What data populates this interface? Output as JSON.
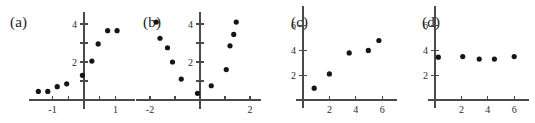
{
  "figure": {
    "title": "",
    "panel_count": 4,
    "background_color": "#ffffff",
    "point_color": "#151515",
    "axis_color": "#4a4a4a"
  },
  "panels": [
    {
      "label": "(a)",
      "label_name": "panel-label-a",
      "x_ticks": [
        -1,
        1
      ],
      "x_minor_ticks": [
        -0.5,
        0.5
      ],
      "y_ticks": [
        2,
        4
      ],
      "y_minor_ticks": [
        1,
        3
      ],
      "x_range": [
        -1.75,
        1.6
      ],
      "y_range": [
        -0.55,
        4.6
      ],
      "pattern": "increasing-nonlinear"
    },
    {
      "label": "(b)",
      "label_name": "panel-label-b",
      "x_ticks": [
        -2,
        2
      ],
      "x_minor_ticks": [
        -1,
        1
      ],
      "y_ticks": [
        2,
        4
      ],
      "y_minor_ticks": [
        1,
        3
      ],
      "x_range": [
        -2.6,
        2.5
      ],
      "y_range": [
        -0.55,
        4.6
      ],
      "pattern": "u-shaped"
    },
    {
      "label": "(c)",
      "label_name": "panel-label-c",
      "x_ticks": [
        2,
        4,
        6
      ],
      "x_minor_ticks": [],
      "y_ticks": [
        2,
        4,
        6
      ],
      "y_minor_ticks": [],
      "x_range": [
        -0.55,
        7.2
      ],
      "y_range": [
        -0.8,
        7.6
      ],
      "pattern": "increasing-linear"
    },
    {
      "label": "(d)",
      "label_name": "panel-label-d",
      "x_ticks": [
        2,
        4,
        6
      ],
      "x_minor_ticks": [],
      "y_ticks": [
        2,
        4,
        6
      ],
      "y_minor_ticks": [],
      "x_range": [
        -0.55,
        7.2
      ],
      "y_range": [
        -0.8,
        7.6
      ],
      "pattern": "flat-no-correlation"
    }
  ],
  "chart_data": [
    {
      "type": "scatter",
      "title": "(a)",
      "xlabel": "",
      "ylabel": "",
      "xlim": [
        -1.75,
        1.6
      ],
      "ylim": [
        -0.55,
        4.6
      ],
      "xticks": [
        -1,
        1
      ],
      "yticks": [
        2,
        4
      ],
      "grid": false,
      "legend": false,
      "x": [
        -1.45,
        -1.15,
        -0.85,
        -0.55,
        -0.05,
        0.25,
        0.45,
        0.75,
        1.05
      ],
      "y": [
        0.45,
        0.45,
        0.7,
        0.85,
        1.3,
        2.05,
        2.95,
        3.65,
        3.65
      ]
    },
    {
      "type": "scatter",
      "title": "(b)",
      "xlabel": "",
      "ylabel": "",
      "xlim": [
        -2.6,
        2.5
      ],
      "ylim": [
        -0.55,
        4.6
      ],
      "xticks": [
        -2,
        2
      ],
      "yticks": [
        2,
        4
      ],
      "grid": false,
      "legend": false,
      "x": [
        -1.75,
        -1.6,
        -1.3,
        -1.1,
        -0.75,
        -0.1,
        0.45,
        1.05,
        1.2,
        1.35,
        1.45
      ],
      "y": [
        4.1,
        3.25,
        2.75,
        2.0,
        1.1,
        0.35,
        0.75,
        1.6,
        2.85,
        3.45,
        4.1
      ]
    },
    {
      "type": "scatter",
      "title": "(c)",
      "xlabel": "",
      "ylabel": "",
      "xlim": [
        -0.55,
        7.2
      ],
      "ylim": [
        -0.8,
        7.6
      ],
      "xticks": [
        2,
        4,
        6
      ],
      "yticks": [
        2,
        4,
        6
      ],
      "grid": false,
      "legend": false,
      "x": [
        0.85,
        2.0,
        3.5,
        4.95,
        5.75
      ],
      "y": [
        0.95,
        2.1,
        3.8,
        4.0,
        4.8
      ]
    },
    {
      "type": "scatter",
      "title": "(d)",
      "xlabel": "",
      "ylabel": "",
      "xlim": [
        -0.55,
        7.2
      ],
      "ylim": [
        -0.8,
        7.6
      ],
      "xticks": [
        2,
        4,
        6
      ],
      "yticks": [
        2,
        4,
        6
      ],
      "grid": false,
      "legend": false,
      "x": [
        0.25,
        2.1,
        3.35,
        4.5,
        6.0
      ],
      "y": [
        3.45,
        3.5,
        3.3,
        3.3,
        3.5
      ]
    }
  ]
}
